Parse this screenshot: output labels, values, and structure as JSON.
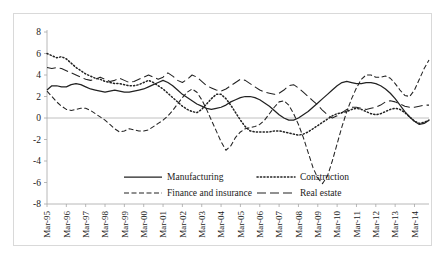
{
  "figure": {
    "border_color": "#d9d9d9",
    "background": "#ffffff"
  },
  "chart_data": {
    "type": "line",
    "title": "",
    "subtitle": "",
    "xlabel": "",
    "ylabel": "",
    "ylim": [
      -8,
      8
    ],
    "ytick_values": [
      8,
      6,
      4,
      2,
      0,
      -2,
      -4,
      -6,
      -8
    ],
    "ytick_labels": [
      "8",
      "6",
      "4",
      "2",
      "0",
      "-2",
      "-4",
      "-6",
      "-8"
    ],
    "grid": false,
    "zero_line": true,
    "legend_position": "inside-bottom-center",
    "xlabel_rotation": -90,
    "x_tick_labels": [
      "Mar-95",
      "Mar-96",
      "Mar-97",
      "Mar-98",
      "Mar-99",
      "Mar-00",
      "Mar-01",
      "Mar-02",
      "Mar-03",
      "Mar-04",
      "Mar-05",
      "Mar-06",
      "Mar-07",
      "Mar-08",
      "Mar-09",
      "Mar-10",
      "Mar-11",
      "Mar-12",
      "Mar-13",
      "Mar-14"
    ],
    "x_points_per_label": 4,
    "series": [
      {
        "name": "Manufacturing",
        "line_style": "solid",
        "color": "#222222",
        "values": [
          2.6,
          3.0,
          3.0,
          2.9,
          2.9,
          3.1,
          3.2,
          3.1,
          2.9,
          2.7,
          2.6,
          2.5,
          2.4,
          2.5,
          2.6,
          2.5,
          2.4,
          2.4,
          2.5,
          2.6,
          2.7,
          2.9,
          3.1,
          3.3,
          3.5,
          3.3,
          3.0,
          2.6,
          2.2,
          1.9,
          1.6,
          1.3,
          1.1,
          0.9,
          0.8,
          0.9,
          1.0,
          1.2,
          1.5,
          1.7,
          1.9,
          2.0,
          2.0,
          1.9,
          1.7,
          1.4,
          1.1,
          0.7,
          0.3,
          0.0,
          -0.2,
          -0.2,
          0.0,
          0.3,
          0.6,
          1.0,
          1.4,
          1.8,
          2.2,
          2.6,
          3.0,
          3.3,
          3.4,
          3.3,
          3.2,
          3.2,
          3.3,
          3.3,
          3.2,
          3.0,
          2.7,
          2.3,
          1.8,
          1.2,
          0.6,
          0.1,
          -0.3,
          -0.6,
          -0.5,
          -0.2
        ]
      },
      {
        "name": "Finance and insurance",
        "line_style": "dashed",
        "color": "#222222",
        "values": [
          2.5,
          2.0,
          1.5,
          1.1,
          0.8,
          0.7,
          0.8,
          0.9,
          0.9,
          0.7,
          0.4,
          0.1,
          -0.2,
          -0.6,
          -1.0,
          -1.3,
          -1.2,
          -1.0,
          -1.1,
          -1.2,
          -1.2,
          -1.1,
          -0.8,
          -0.5,
          -0.2,
          0.2,
          0.7,
          1.3,
          1.9,
          2.4,
          2.7,
          2.4,
          1.7,
          0.8,
          -0.2,
          -1.2,
          -2.2,
          -3.0,
          -2.6,
          -1.8,
          -1.3,
          -1.0,
          -0.9,
          -0.8,
          -0.6,
          -0.2,
          0.4,
          1.0,
          1.5,
          1.6,
          1.2,
          0.4,
          -0.6,
          -1.8,
          -3.2,
          -4.6,
          -5.6,
          -6.1,
          -5.4,
          -4.0,
          -2.4,
          -0.8,
          0.6,
          1.8,
          2.8,
          3.6,
          4.0,
          4.0,
          3.8,
          3.8,
          3.9,
          3.7,
          3.2,
          2.6,
          2.1,
          2.0,
          2.6,
          3.6,
          4.6,
          5.4
        ]
      },
      {
        "name": "Construction",
        "line_style": "dotted",
        "color": "#222222",
        "values": [
          6.0,
          5.8,
          5.6,
          5.7,
          5.5,
          5.1,
          4.7,
          4.4,
          4.1,
          3.9,
          3.7,
          3.6,
          3.4,
          3.3,
          3.2,
          3.2,
          3.1,
          3.0,
          3.0,
          3.1,
          3.3,
          3.5,
          3.3,
          3.0,
          2.7,
          2.3,
          1.9,
          1.5,
          1.1,
          0.8,
          0.6,
          0.5,
          0.8,
          1.3,
          1.8,
          2.2,
          2.2,
          1.8,
          1.2,
          0.5,
          -0.2,
          -0.8,
          -1.2,
          -1.3,
          -1.3,
          -1.3,
          -1.3,
          -1.2,
          -1.2,
          -1.3,
          -1.4,
          -1.5,
          -1.6,
          -1.5,
          -1.3,
          -1.0,
          -0.7,
          -0.4,
          -0.1,
          0.2,
          0.4,
          0.5,
          0.6,
          0.8,
          0.9,
          0.8,
          0.6,
          0.4,
          0.3,
          0.4,
          0.6,
          0.8,
          0.9,
          0.8,
          0.5,
          0.1,
          -0.3,
          -0.5,
          -0.4,
          -0.2
        ]
      },
      {
        "name": "Real estate",
        "line_style": "longdash",
        "color": "#222222",
        "values": [
          4.7,
          4.6,
          4.7,
          4.6,
          4.4,
          4.2,
          4.0,
          3.8,
          3.6,
          3.5,
          3.6,
          3.8,
          3.6,
          3.4,
          3.5,
          3.7,
          3.5,
          3.3,
          3.4,
          3.6,
          3.8,
          4.0,
          3.8,
          3.6,
          3.8,
          4.2,
          3.9,
          3.5,
          3.3,
          3.6,
          4.0,
          3.8,
          3.4,
          3.0,
          2.8,
          2.6,
          2.5,
          2.7,
          3.0,
          3.3,
          3.6,
          3.5,
          3.2,
          2.9,
          2.6,
          2.4,
          2.3,
          2.2,
          2.3,
          2.6,
          3.0,
          3.1,
          2.8,
          2.4,
          2.0,
          1.6,
          1.2,
          0.7,
          0.3,
          0.0,
          0.2,
          0.5,
          0.8,
          1.0,
          1.0,
          0.9,
          0.8,
          0.9,
          1.0,
          1.2,
          1.5,
          1.6,
          1.5,
          1.3,
          1.1,
          1.0,
          1.0,
          1.1,
          1.2,
          1.2
        ]
      }
    ]
  },
  "legend": {
    "items": [
      {
        "label": "Manufacturing",
        "style": "solid"
      },
      {
        "label": "Finance and insurance",
        "style": "dashed"
      },
      {
        "label": "Construction",
        "style": "dotted"
      },
      {
        "label": "Real estate",
        "style": "longdash"
      }
    ]
  }
}
